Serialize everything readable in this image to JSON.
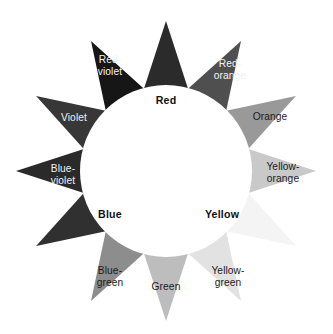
{
  "figure": {
    "background": "#ffffff",
    "hub_color": "#ffffff",
    "center": {
      "x": 166,
      "y": 171
    },
    "hub_radius": 86,
    "outer_radius": 150
  },
  "chart_data": {
    "type": "pie",
    "xlabel": "",
    "ylabel": "",
    "legend_position": "none",
    "grid": false,
    "categories": [
      "Red",
      "Red-orange",
      "Orange",
      "Yellow-orange",
      "Yellow",
      "Yellow-green",
      "Green",
      "Blue-green",
      "Blue",
      "Blue-violet",
      "Violet",
      "Red-violet"
    ],
    "values": [
      30,
      30,
      30,
      30,
      30,
      30,
      30,
      30,
      30,
      30,
      30,
      30
    ],
    "series": [
      {
        "name": "Color wheel points",
        "values": [
          30,
          30,
          30,
          30,
          30,
          30,
          30,
          30,
          30,
          30,
          30,
          30
        ]
      }
    ]
  },
  "wheel": {
    "points": [
      {
        "label": "Red",
        "label_line1": "Red",
        "label_line2": "",
        "angle_deg": -90,
        "fill": "#2b2b2b",
        "text_color": "#111111",
        "is_primary": true,
        "label_inside_hub": true,
        "label_x": 166,
        "label_y": 101
      },
      {
        "label": "Red-orange",
        "label_line1": "Red-",
        "label_line2": "orange",
        "angle_deg": -60,
        "fill": "#4f4f4f",
        "text_color": "#f2f2f2",
        "is_primary": false,
        "label_inside_hub": false,
        "label_x": 230,
        "label_y": 70
      },
      {
        "label": "Orange",
        "label_line1": "Orange",
        "label_line2": "",
        "angle_deg": -30,
        "fill": "#999999",
        "text_color": "#1a1a1a",
        "is_primary": false,
        "label_inside_hub": false,
        "label_x": 270,
        "label_y": 117
      },
      {
        "label": "Yellow-orange",
        "label_line1": "Yellow-",
        "label_line2": "orange",
        "angle_deg": 0,
        "fill": "#c9c9c9",
        "text_color": "#1a1a1a",
        "is_primary": false,
        "label_inside_hub": false,
        "label_x": 283,
        "label_y": 173
      },
      {
        "label": "Yellow",
        "label_line1": "Yellow",
        "label_line2": "",
        "angle_deg": 30,
        "fill": "#f4f4f4",
        "text_color": "#111111",
        "is_primary": true,
        "label_inside_hub": true,
        "label_x": 222,
        "label_y": 215
      },
      {
        "label": "Yellow-green",
        "label_line1": "Yellow-",
        "label_line2": "green",
        "angle_deg": 60,
        "fill": "#e2e2e2",
        "text_color": "#1a1a1a",
        "is_primary": false,
        "label_inside_hub": false,
        "label_x": 228,
        "label_y": 277
      },
      {
        "label": "Green",
        "label_line1": "Green",
        "label_line2": "",
        "angle_deg": 90,
        "fill": "#bdbdbd",
        "text_color": "#1a1a1a",
        "is_primary": false,
        "label_inside_hub": false,
        "label_x": 166,
        "label_y": 287
      },
      {
        "label": "Blue-green",
        "label_line1": "Blue-",
        "label_line2": "green",
        "angle_deg": 120,
        "fill": "#8d8d8d",
        "text_color": "#1a1a1a",
        "is_primary": false,
        "label_inside_hub": false,
        "label_x": 110,
        "label_y": 277
      },
      {
        "label": "Blue",
        "label_line1": "Blue",
        "label_line2": "",
        "angle_deg": 150,
        "fill": "#303030",
        "text_color": "#111111",
        "is_primary": true,
        "label_inside_hub": true,
        "label_x": 110,
        "label_y": 215
      },
      {
        "label": "Blue-violet",
        "label_line1": "Blue-",
        "label_line2": "violet",
        "angle_deg": 180,
        "fill": "#2a2a2a",
        "text_color": "#f2f2f2",
        "is_primary": false,
        "label_inside_hub": false,
        "label_x": 63,
        "label_y": 175
      },
      {
        "label": "Violet",
        "label_line1": "Violet",
        "label_line2": "",
        "angle_deg": -150,
        "fill": "#373737",
        "text_color": "#f2f2f2",
        "is_primary": false,
        "label_inside_hub": false,
        "label_x": 74,
        "label_y": 118
      },
      {
        "label": "Red-violet",
        "label_line1": "Red-",
        "label_line2": "violet",
        "angle_deg": -120,
        "fill": "#161616",
        "text_color": "#f2f2f2",
        "is_primary": false,
        "label_inside_hub": false,
        "label_x": 110,
        "label_y": 66
      }
    ]
  }
}
